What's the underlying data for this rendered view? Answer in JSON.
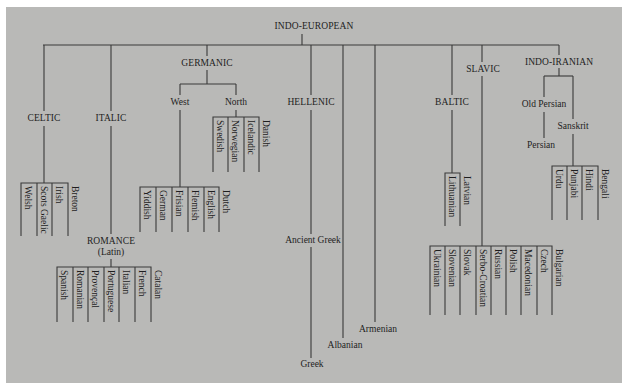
{
  "colors": {
    "background": "#b9b9b7",
    "line": "#3a3a3a",
    "text": "#1e1e1e"
  },
  "root": {
    "label": "INDO-EUROPEAN",
    "x": 314,
    "y": 21
  },
  "branches": {
    "celtic": {
      "label": "CELTIC",
      "x": 44,
      "y": 113,
      "languages": [
        "Welsh",
        "Scots Gaelic",
        "Irish",
        "Breton"
      ]
    },
    "italic": {
      "label": "ITALIC",
      "x": 111,
      "y": 113
    },
    "romance": {
      "label": "ROMANCE",
      "sublabel": "(Latin)",
      "x": 111,
      "y": 236,
      "languages": [
        "Spanish",
        "Romanian",
        "Provençal",
        "Portuguese",
        "Italian",
        "French",
        "Catalan"
      ]
    },
    "germanic": {
      "label": "GERMANIC",
      "x": 207,
      "y": 58
    },
    "west": {
      "label": "West",
      "x": 180,
      "y": 97,
      "languages": [
        "Yiddish",
        "German",
        "Frisian",
        "Flemish",
        "English",
        "Dutch"
      ]
    },
    "north": {
      "label": "North",
      "x": 236,
      "y": 97,
      "languages": [
        "Swedish",
        "Norwegian",
        "Icelandic",
        "Danish"
      ]
    },
    "hellenic": {
      "label": "HELLENIC",
      "x": 311,
      "y": 97,
      "descendants": [
        "Ancient Greek",
        "Greek"
      ]
    },
    "albanian": {
      "label": "Albanian",
      "x": 343,
      "y": 340
    },
    "armenian": {
      "label": "Armenian",
      "x": 375,
      "y": 324
    },
    "baltic": {
      "label": "BALTIC",
      "x": 452,
      "y": 97,
      "languages": [
        "Lithuanian",
        "Latvian"
      ]
    },
    "slavic": {
      "label": "SLAVIC",
      "x": 483,
      "y": 64,
      "languages": [
        "Ukrainian",
        "Slovenian",
        "Slovak",
        "Serbo-Croatian",
        "Russian",
        "Polish",
        "Macedonian",
        "Czech",
        "Bulgarian"
      ]
    },
    "indo_iranian": {
      "label": "INDO-IRANIAN",
      "x": 559,
      "y": 57
    },
    "old_persian": {
      "label": "Old Persian",
      "x": 544,
      "y": 99,
      "descendant": "Persian"
    },
    "sanskrit": {
      "label": "Sanskrit",
      "x": 573,
      "y": 121,
      "languages": [
        "Urdu",
        "Punjabi",
        "Hindi",
        "Bengali"
      ]
    }
  }
}
